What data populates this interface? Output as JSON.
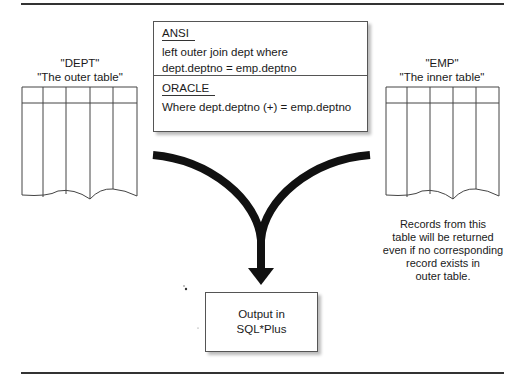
{
  "dept_table": {
    "name": "\"DEPT\"",
    "role": "\"The outer table\"",
    "columns": 5
  },
  "emp_table": {
    "name": "\"EMP\"",
    "role": "\"The inner table\"",
    "columns": 5
  },
  "sql_box": {
    "ansi": {
      "heading": "ANSI",
      "line1": "left outer join dept where",
      "line2": "dept.deptno = emp.deptno"
    },
    "oracle": {
      "heading": "ORACLE",
      "line1": "Where dept.deptno (+) = emp.deptno"
    }
  },
  "output_box": {
    "line1": "Output in",
    "line2": "SQL*Plus"
  },
  "note": {
    "lines": [
      "Records from this",
      "table will be returned",
      "even if no corresponding",
      "record exists in",
      "outer table."
    ]
  },
  "colors": {
    "line": "#333333",
    "arrow": "#111111",
    "shadow": "#bbbbbb"
  }
}
